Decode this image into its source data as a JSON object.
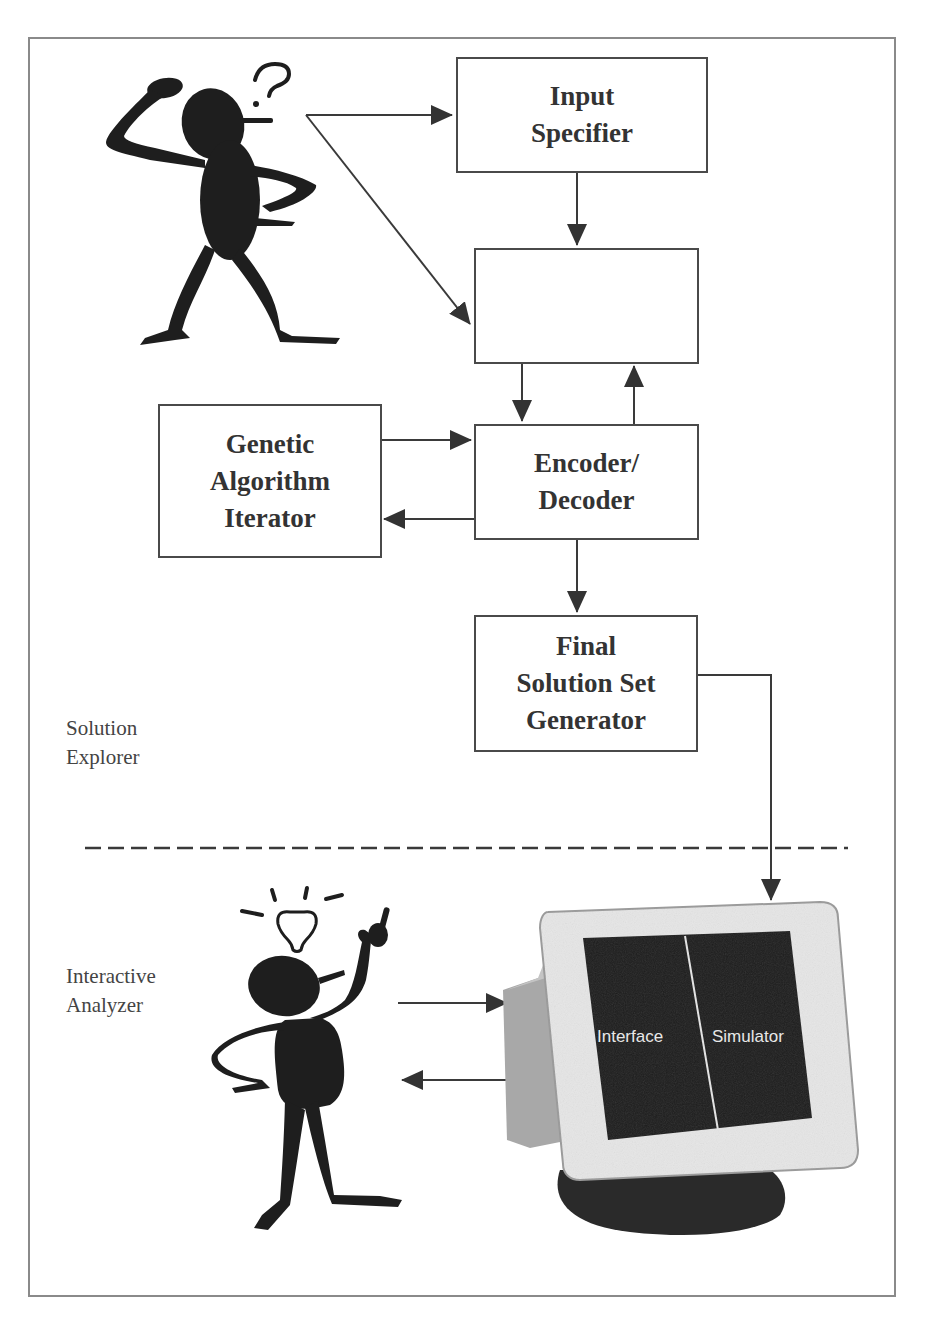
{
  "page": {
    "number": "347"
  },
  "diagram": {
    "boxes": {
      "input_specifier": "Input\nSpecifier",
      "unlabeled_box": "",
      "genetic_algorithm_iterator": "Genetic\nAlgorithm\nIterator",
      "encoder_decoder": "Encoder/\nDecoder",
      "final_solution_set_generator": "Final\nSolution Set\nGenerator"
    },
    "sections": {
      "solution_explorer": "Solution\nExplorer",
      "interactive_analyzer": "Interactive\nAnalyzer"
    },
    "monitor": {
      "left_pane": "Interface",
      "right_pane": "Simulator"
    },
    "figures": {
      "top": "confused-user (question mark)",
      "bottom": "enlightened-user (light bulb)"
    },
    "colors": {
      "line": "#3a3a3a",
      "frame": "#8a8a8a",
      "screen": "#1c1c1c",
      "bezel": "#e6e6e6"
    }
  }
}
